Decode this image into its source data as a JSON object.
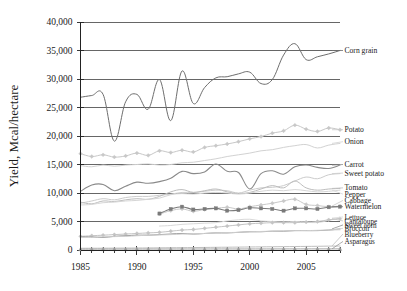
{
  "chart_data": {
    "type": "line",
    "title": "",
    "xlabel": "",
    "ylabel": "Yield, Mcal/hectare",
    "xlim": [
      1985,
      2008
    ],
    "ylim": [
      0,
      40000
    ],
    "yticks": [
      0,
      5000,
      10000,
      15000,
      20000,
      25000,
      30000,
      35000,
      40000
    ],
    "ytick_labels": [
      "0",
      "5,000",
      "10,000",
      "15,000",
      "20,000",
      "25,000",
      "30,000",
      "35,000",
      "40,000"
    ],
    "xticks": [
      1985,
      1990,
      1995,
      2000,
      2005
    ],
    "xtick_labels": [
      "1985",
      "1990",
      "1995",
      "2000",
      "2005"
    ],
    "xtick_minor_step": 1,
    "grid": "horizontal",
    "legend_position": "right-inline-labels",
    "series": [
      {
        "name": "Corn grain",
        "color": "#6e6e6e",
        "width": 1.0,
        "marker": "none",
        "label_y": 35000,
        "x": [
          1985,
          1986,
          1987,
          1988,
          1989,
          1990,
          1991,
          1992,
          1993,
          1994,
          1995,
          1996,
          1997,
          1998,
          1999,
          2000,
          2001,
          2002,
          2003,
          2004,
          2005,
          2006,
          2007,
          2008
        ],
        "values": [
          26800,
          27100,
          27300,
          19100,
          26000,
          27300,
          24700,
          29900,
          22700,
          31400,
          25700,
          28500,
          30200,
          30400,
          30900,
          31200,
          29200,
          29900,
          34200,
          36200,
          33400,
          33900,
          34400,
          35000
        ]
      },
      {
        "name": "Potato",
        "color": "#c8c8c8",
        "width": 1.0,
        "marker": "diamond",
        "label_y": 21100,
        "x": [
          1985,
          1986,
          1987,
          1988,
          1989,
          1990,
          1991,
          1992,
          1993,
          1994,
          1995,
          1996,
          1997,
          1998,
          1999,
          2000,
          2001,
          2002,
          2003,
          2004,
          2005,
          2006,
          2007,
          2008
        ],
        "values": [
          16900,
          16400,
          16700,
          16300,
          16500,
          17000,
          16600,
          17400,
          17100,
          17500,
          17200,
          18000,
          18300,
          18600,
          19000,
          19500,
          19900,
          20500,
          20900,
          21900,
          21200,
          20800,
          21400,
          21100
        ]
      },
      {
        "name": "Onion",
        "color": "#d2d2d2",
        "width": 1.0,
        "marker": "none",
        "label_y": 19000,
        "x": [
          1985,
          1986,
          1987,
          1988,
          1989,
          1990,
          1991,
          1992,
          1993,
          1994,
          1995,
          1996,
          1997,
          1998,
          1999,
          2000,
          2001,
          2002,
          2003,
          2004,
          2005,
          2006,
          2007,
          2008
        ],
        "values": [
          14800,
          14600,
          14900,
          14700,
          14900,
          15000,
          15100,
          14900,
          15000,
          15300,
          15400,
          15700,
          16000,
          16400,
          16700,
          17000,
          17400,
          17600,
          18000,
          18300,
          18500,
          17900,
          18400,
          18700
        ]
      },
      {
        "name": "Carrot",
        "color": "#8a8a8a",
        "width": 1.1,
        "marker": "none",
        "label_y": 15000,
        "x": [
          1985,
          1986,
          1987,
          1988,
          1989,
          1990,
          1991,
          1992,
          1993,
          1994,
          1995,
          1996,
          1997,
          1998,
          1999,
          2000,
          2001,
          2002,
          2003,
          2004,
          2005,
          2006,
          2007,
          2008
        ],
        "values": [
          10300,
          11400,
          11500,
          10400,
          11200,
          11900,
          11700,
          12000,
          12600,
          13800,
          13400,
          13700,
          15100,
          13800,
          13600,
          10700,
          13400,
          13900,
          13300,
          14600,
          14900,
          14500,
          14300,
          14900
        ]
      },
      {
        "name": "Sweet potato",
        "color": "#cccccc",
        "width": 1.0,
        "marker": "none",
        "label_y": 13500,
        "x": [
          1985,
          1986,
          1987,
          1988,
          1989,
          1990,
          1991,
          1992,
          1993,
          1994,
          1995,
          1996,
          1997,
          1998,
          1999,
          2000,
          2001,
          2002,
          2003,
          2004,
          2005,
          2006,
          2007,
          2008
        ],
        "values": [
          8200,
          8600,
          9000,
          8800,
          9200,
          9400,
          9400,
          9600,
          9800,
          10100,
          10100,
          10300,
          10500,
          10400,
          10000,
          10500,
          10900,
          11000,
          11300,
          12100,
          12800,
          12500,
          13200,
          13400
        ]
      },
      {
        "name": "Tomato",
        "color": "#bdbdbd",
        "width": 1.0,
        "marker": "none",
        "label_y": 10900,
        "x": [
          1985,
          1986,
          1987,
          1988,
          1989,
          1990,
          1991,
          1992,
          1993,
          1994,
          1995,
          1996,
          1997,
          1998,
          1999,
          2000,
          2001,
          2002,
          2003,
          2004,
          2005,
          2006,
          2007,
          2008
        ],
        "values": [
          8400,
          8100,
          8600,
          8500,
          8800,
          9000,
          8900,
          9400,
          10200,
          10600,
          10100,
          10400,
          10700,
          10200,
          9900,
          10100,
          10700,
          11300,
          10900,
          12100,
          10900,
          10500,
          10700,
          10800
        ]
      },
      {
        "name": "Pepper",
        "color": "#d6d6d6",
        "width": 1.0,
        "marker": "none",
        "label_y": 9800,
        "x": [
          1985,
          1986,
          1987,
          1988,
          1989,
          1990,
          1991,
          1992,
          1993,
          1994,
          1995,
          1996,
          1997,
          1998,
          1999,
          2000,
          2001,
          2002,
          2003,
          2004,
          2005,
          2006,
          2007,
          2008
        ],
        "values": [
          7900,
          8000,
          8300,
          8400,
          8600,
          8700,
          8900,
          9100,
          9700,
          9900,
          9800,
          10000,
          10100,
          10000,
          9800,
          10000,
          10300,
          10500,
          10400,
          10600,
          10400,
          10200,
          10300,
          10500
        ]
      },
      {
        "name": "Cabbage",
        "color": "#c9c9c9",
        "width": 1.0,
        "marker": "diamond",
        "label_y": 8700,
        "x": [
          1992,
          1993,
          1994,
          1995,
          1996,
          1997,
          1998,
          1999,
          2000,
          2001,
          2002,
          2003,
          2004,
          2005,
          2006,
          2007,
          2008
        ],
        "values": [
          6300,
          6900,
          7200,
          6800,
          7100,
          7300,
          7500,
          7200,
          7600,
          7900,
          8200,
          8600,
          8900,
          8000,
          7800,
          7600,
          7700
        ]
      },
      {
        "name": "Watermelon",
        "color": "#7a7a7a",
        "width": 1.1,
        "marker": "square",
        "label_y": 7600,
        "x": [
          1992,
          1993,
          1994,
          1995,
          1996,
          1997,
          1998,
          1999,
          2000,
          2001,
          2002,
          2003,
          2004,
          2005,
          2006,
          2007,
          2008
        ],
        "values": [
          6400,
          7200,
          7600,
          7100,
          7200,
          7300,
          6900,
          7000,
          7400,
          7300,
          7200,
          6900,
          7300,
          7300,
          7200,
          7500,
          7600
        ]
      },
      {
        "name": "Lettuce",
        "color": "#d9d9d9",
        "width": 1.0,
        "marker": "none",
        "label_y": 5800,
        "x": [
          1992,
          1993,
          1994,
          1995,
          1996,
          1997,
          1998,
          1999,
          2000,
          2001,
          2002,
          2003,
          2004,
          2005,
          2006,
          2007,
          2008
        ],
        "values": [
          4200,
          4300,
          4500,
          4600,
          4700,
          4800,
          5100,
          5300,
          5400,
          5100,
          5000,
          4900,
          5000,
          4900,
          4800,
          5200,
          5600
        ]
      },
      {
        "name": "Cantaloupe",
        "color": "#c4c4c4",
        "width": 1.0,
        "marker": "diamond",
        "label_y": 5100,
        "x": [
          1985,
          1986,
          1987,
          1988,
          1989,
          1990,
          1991,
          1992,
          1993,
          1994,
          1995,
          1996,
          1997,
          1998,
          1999,
          2000,
          2001,
          2002,
          2003,
          2004,
          2005,
          2006,
          2007,
          2008
        ],
        "values": [
          2400,
          2500,
          2600,
          2700,
          2800,
          2900,
          3000,
          3100,
          3300,
          3500,
          3600,
          3800,
          4000,
          4200,
          4400,
          4600,
          4700,
          4800,
          4800,
          4800,
          4900,
          5000,
          5300,
          5500
        ]
      },
      {
        "name": "Sweet corn",
        "color": "#8f8f8f",
        "width": 1.0,
        "marker": "none",
        "label_y": 4400,
        "x": [
          1985,
          1986,
          1987,
          1988,
          1989,
          1990,
          1991,
          1992,
          1993,
          1994,
          1995,
          1996,
          1997,
          1998,
          1999,
          2000,
          2001,
          2002,
          2003,
          2004,
          2005,
          2006,
          2007,
          2008
        ],
        "values": [
          2300,
          2300,
          2200,
          2400,
          2500,
          2600,
          2600,
          2700,
          2800,
          2900,
          2800,
          2900,
          3000,
          3000,
          3100,
          3200,
          3200,
          3300,
          3300,
          3400,
          3400,
          3400,
          3500,
          3700
        ]
      },
      {
        "name": "Broccoli",
        "color": "#cfcfcf",
        "width": 1.0,
        "marker": "none",
        "label_y": 3800,
        "x": [
          1985,
          1986,
          1987,
          1988,
          1989,
          1990,
          1991,
          1992,
          1993,
          1994,
          1995,
          1996,
          1997,
          1998,
          1999,
          2000,
          2001,
          2002,
          2003,
          2004,
          2005,
          2006,
          2007,
          2008
        ],
        "values": [
          2200,
          2250,
          2300,
          2350,
          2400,
          2500,
          2600,
          2650,
          2700,
          2800,
          2850,
          2900,
          3000,
          3050,
          3100,
          3200,
          3250,
          3300,
          3350,
          3400,
          3400,
          3450,
          3500,
          3550
        ]
      },
      {
        "name": "Blueberry",
        "color": "#bfbfbf",
        "width": 1.0,
        "marker": "none",
        "label_y": 2800,
        "x": [
          1985,
          1986,
          1987,
          1988,
          1989,
          1990,
          1991,
          1992,
          1993,
          1994,
          1995,
          1996,
          1997,
          1998,
          1999,
          2000,
          2001,
          2002,
          2003,
          2004,
          2005,
          2006,
          2007,
          2008
        ],
        "values": [
          300,
          310,
          320,
          330,
          340,
          350,
          360,
          380,
          400,
          410,
          430,
          450,
          470,
          490,
          510,
          530,
          550,
          570,
          590,
          610,
          630,
          650,
          680,
          700
        ]
      },
      {
        "name": "Asparagus",
        "color": "#9a9a9a",
        "width": 0.9,
        "marker": "triangle",
        "label_y": 1500,
        "x": [
          1985,
          1986,
          1987,
          1988,
          1989,
          1990,
          1991,
          1992,
          1993,
          1994,
          1995,
          1996,
          1997,
          1998,
          1999,
          2000,
          2001,
          2002,
          2003,
          2004,
          2005,
          2006,
          2007,
          2008
        ],
        "values": [
          150,
          150,
          155,
          155,
          160,
          160,
          165,
          165,
          170,
          170,
          175,
          175,
          180,
          180,
          180,
          185,
          185,
          185,
          190,
          190,
          190,
          195,
          195,
          200
        ]
      }
    ]
  },
  "legend_labels": [
    {
      "name": "Corn grain",
      "size": "normal"
    },
    {
      "name": "Potato",
      "size": "normal"
    },
    {
      "name": "Onion",
      "size": "normal"
    },
    {
      "name": "Carrot",
      "size": "normal"
    },
    {
      "name": "Sweet potato",
      "size": "normal"
    },
    {
      "name": "Tomato",
      "size": "normal"
    },
    {
      "name": "Pepper",
      "size": "normal"
    },
    {
      "name": "Cabbage",
      "size": "normal"
    },
    {
      "name": "Watermelon",
      "size": "normal"
    },
    {
      "name": "Lettuce",
      "size": "small"
    },
    {
      "name": "Cantaloupe",
      "size": "small"
    },
    {
      "name": "Sweet corn",
      "size": "small"
    },
    {
      "name": "Broccoli",
      "size": "small"
    },
    {
      "name": "Blueberry",
      "size": "small"
    },
    {
      "name": "Asparagus",
      "size": "small"
    }
  ],
  "colors": {
    "background": "#ffffff",
    "axis": "#222222",
    "gridline": "#555555",
    "text": "#1a1a1a"
  }
}
